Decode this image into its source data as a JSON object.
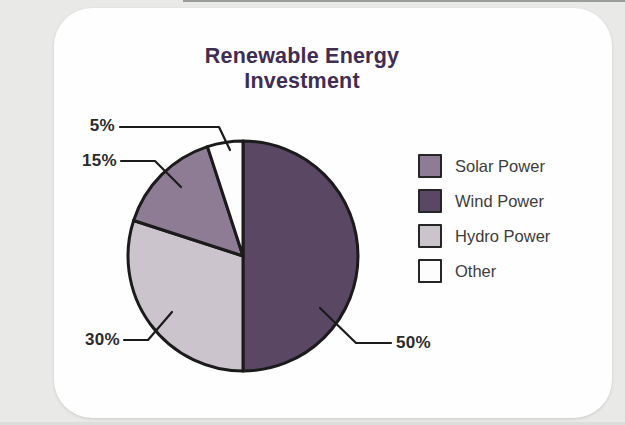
{
  "chart_data": {
    "type": "pie",
    "title": "Renewable Energy Investment",
    "units": "%",
    "slices": [
      {
        "name": "Solar Power",
        "value": 15,
        "label": "15%",
        "color": "#8d7c94"
      },
      {
        "name": "Wind Power",
        "value": 50,
        "label": "50%",
        "color": "#5a4763"
      },
      {
        "name": "Hydro Power",
        "value": 30,
        "label": "30%",
        "color": "#cbc4cd"
      },
      {
        "name": "Other",
        "value": 5,
        "label": "5%",
        "color": "#fdfdfd"
      }
    ],
    "legend": [
      "Solar Power",
      "Wind Power",
      "Hydro Power",
      "Other"
    ],
    "legend_position": "right",
    "clockwise_from_top": [
      "Wind Power",
      "Hydro Power",
      "Solar Power",
      "Other"
    ],
    "slice_outline_color": "#1b1b1b",
    "title_color": "#3f2d52"
  }
}
